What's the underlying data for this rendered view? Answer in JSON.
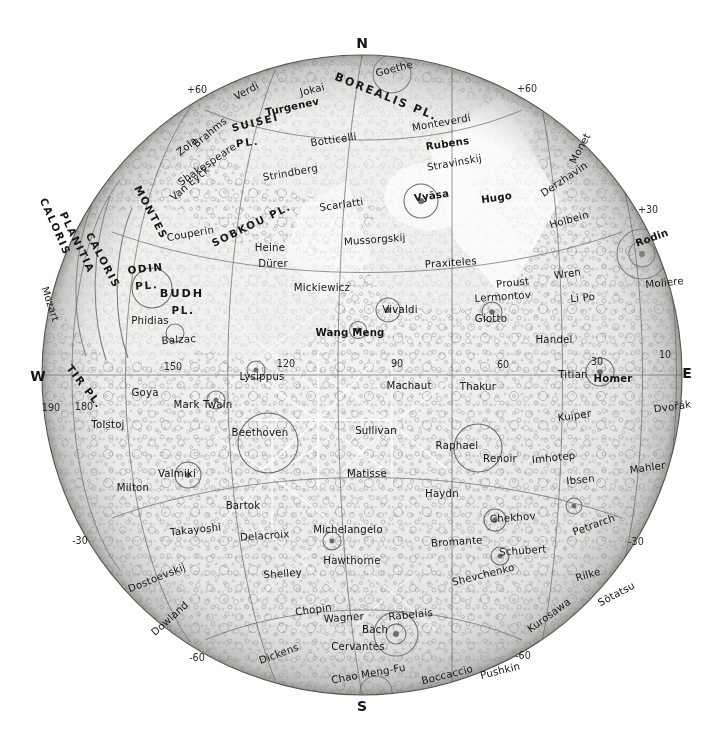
{
  "map": {
    "title": "Mercury",
    "projection": "orthographic hemisphere",
    "center": {
      "x": 362,
      "y": 375,
      "radius": 320
    },
    "cardinals": [
      {
        "name": "north",
        "label": "N",
        "x": 362,
        "y": 48
      },
      {
        "name": "south",
        "label": "S",
        "x": 362,
        "y": 711
      },
      {
        "name": "west",
        "label": "W",
        "x": 38,
        "y": 381
      },
      {
        "name": "east",
        "label": "E",
        "x": 687,
        "y": 378
      }
    ],
    "latitude_labels": [
      {
        "label": "+60",
        "x": 197,
        "y": 93,
        "side": "left"
      },
      {
        "label": "+60",
        "x": 527,
        "y": 92,
        "side": "right"
      },
      {
        "label": "+30",
        "x": 648,
        "y": 213,
        "side": "right"
      },
      {
        "label": "-30",
        "x": 636,
        "y": 545,
        "side": "right"
      },
      {
        "label": "-30",
        "x": 80,
        "y": 544,
        "side": "left"
      },
      {
        "label": "-60",
        "x": 197,
        "y": 661,
        "side": "left"
      },
      {
        "label": "-60",
        "x": 523,
        "y": 659,
        "side": "right"
      }
    ],
    "longitude_labels": [
      {
        "label": "190",
        "x": 51,
        "y": 411
      },
      {
        "label": "180",
        "x": 84,
        "y": 410
      },
      {
        "label": "150",
        "x": 173,
        "y": 370
      },
      {
        "label": "120",
        "x": 286,
        "y": 367
      },
      {
        "label": "90",
        "x": 397,
        "y": 367
      },
      {
        "label": "60",
        "x": 503,
        "y": 368
      },
      {
        "label": "30",
        "x": 597,
        "y": 365
      },
      {
        "label": "10",
        "x": 665,
        "y": 358
      }
    ],
    "named_regions": [
      {
        "label": "BOREALIS PL.",
        "x": 385,
        "y": 100,
        "rotate": 22,
        "size": "feature"
      },
      {
        "label": "SUISEI",
        "x": 256,
        "y": 126,
        "rotate": -14,
        "size": "feature-sm"
      },
      {
        "label": "PL.",
        "x": 248,
        "y": 146,
        "rotate": -8,
        "size": "feature-sm"
      },
      {
        "label": "SOBKOU PL.",
        "x": 253,
        "y": 228,
        "rotate": -26,
        "size": "feature-sm"
      },
      {
        "label": "CALORIS",
        "x": 52,
        "y": 228,
        "rotate": 66,
        "size": "feature-sm"
      },
      {
        "label": "PLANITIA",
        "x": 74,
        "y": 244,
        "rotate": 64,
        "size": "feature-sm"
      },
      {
        "label": "CALORIS",
        "x": 100,
        "y": 262,
        "rotate": 62,
        "size": "feature-sm"
      },
      {
        "label": "MONTES",
        "x": 148,
        "y": 214,
        "rotate": 62,
        "size": "feature-sm"
      },
      {
        "label": "ODIN",
        "x": 146,
        "y": 272,
        "rotate": -6,
        "size": "feature-sm"
      },
      {
        "label": "PL.",
        "x": 147,
        "y": 289,
        "rotate": -4,
        "size": "feature-sm"
      },
      {
        "label": "BUDH",
        "x": 182,
        "y": 297,
        "rotate": 0,
        "size": "feature"
      },
      {
        "label": "PL.",
        "x": 183,
        "y": 314,
        "rotate": 0,
        "size": "feature-sm"
      },
      {
        "label": "TIR PL.",
        "x": 82,
        "y": 389,
        "rotate": 52,
        "size": "feature-sm"
      }
    ],
    "craters": [
      {
        "label": "Goethe",
        "x": 395,
        "y": 72,
        "rotate": -14
      },
      {
        "label": "Jokai",
        "x": 313,
        "y": 93,
        "rotate": -14
      },
      {
        "label": "Verdi",
        "x": 248,
        "y": 94,
        "rotate": -28
      },
      {
        "label": "Turgenev",
        "x": 293,
        "y": 110,
        "rotate": -12,
        "bold": true
      },
      {
        "label": "Brahms",
        "x": 212,
        "y": 135,
        "rotate": -40
      },
      {
        "label": "Zola",
        "x": 189,
        "y": 149,
        "rotate": -38
      },
      {
        "label": "Monteverdi",
        "x": 442,
        "y": 126,
        "rotate": -10
      },
      {
        "label": "Botticelli",
        "x": 334,
        "y": 143,
        "rotate": -8
      },
      {
        "label": "Rubens",
        "x": 448,
        "y": 147,
        "rotate": -8,
        "bold": true
      },
      {
        "label": "Shakespeare",
        "x": 209,
        "y": 167,
        "rotate": -34
      },
      {
        "label": "Strindberg",
        "x": 291,
        "y": 176,
        "rotate": -10
      },
      {
        "label": "Stravinskij",
        "x": 455,
        "y": 166,
        "rotate": -10
      },
      {
        "label": "Derzhavin",
        "x": 566,
        "y": 182,
        "rotate": -34
      },
      {
        "label": "Monet",
        "x": 583,
        "y": 150,
        "rotate": -62
      },
      {
        "label": "Van Eyck",
        "x": 192,
        "y": 186,
        "rotate": -40
      },
      {
        "label": "Scarlatti",
        "x": 342,
        "y": 208,
        "rotate": -8
      },
      {
        "label": "Vyāsa",
        "x": 432,
        "y": 199,
        "rotate": -8,
        "bold": true
      },
      {
        "label": "Hugo",
        "x": 497,
        "y": 201,
        "rotate": -8,
        "bold": true
      },
      {
        "label": "Holbein",
        "x": 570,
        "y": 223,
        "rotate": -16
      },
      {
        "label": "Rodin",
        "x": 653,
        "y": 241,
        "rotate": -20,
        "bold": true
      },
      {
        "label": "Couperin",
        "x": 191,
        "y": 237,
        "rotate": -10
      },
      {
        "label": "Heine",
        "x": 270,
        "y": 251
      },
      {
        "label": "Mussorgskij",
        "x": 375,
        "y": 243,
        "rotate": -4
      },
      {
        "label": "Praxiteles",
        "x": 451,
        "y": 266,
        "rotate": -4
      },
      {
        "label": "Wren",
        "x": 568,
        "y": 277,
        "rotate": -8
      },
      {
        "label": "Moliere",
        "x": 665,
        "y": 286,
        "rotate": -6
      },
      {
        "label": "Dürer",
        "x": 273,
        "y": 267
      },
      {
        "label": "Proust",
        "x": 513,
        "y": 286,
        "rotate": -6
      },
      {
        "label": "Lermontov",
        "x": 503,
        "y": 300,
        "rotate": -4
      },
      {
        "label": "Li Po",
        "x": 583,
        "y": 301,
        "rotate": -6
      },
      {
        "label": "Mickiewicz",
        "x": 322,
        "y": 291
      },
      {
        "label": "Vivaldi",
        "x": 400,
        "y": 313
      },
      {
        "label": "Giotto",
        "x": 491,
        "y": 322
      },
      {
        "label": "Phidias",
        "x": 150,
        "y": 324
      },
      {
        "label": "Balzac",
        "x": 179,
        "y": 343,
        "rotate": -4
      },
      {
        "label": "Wang Meng",
        "x": 350,
        "y": 336,
        "bold": true
      },
      {
        "label": "Handel",
        "x": 554,
        "y": 343
      },
      {
        "label": "Mozart",
        "x": 47,
        "y": 305,
        "rotate": 72
      },
      {
        "label": "Lysippus",
        "x": 262,
        "y": 380
      },
      {
        "label": "Machaut",
        "x": 409,
        "y": 389
      },
      {
        "label": "Thakur",
        "x": 478,
        "y": 390
      },
      {
        "label": "Titian",
        "x": 573,
        "y": 378
      },
      {
        "label": "Homer",
        "x": 613,
        "y": 382,
        "bold": true
      },
      {
        "label": "Goya",
        "x": 145,
        "y": 396
      },
      {
        "label": "Mark Twain",
        "x": 203,
        "y": 408
      },
      {
        "label": "Kuiper",
        "x": 575,
        "y": 419,
        "rotate": -8
      },
      {
        "label": "Dvořák",
        "x": 673,
        "y": 410,
        "rotate": -8
      },
      {
        "label": "Tolstoj",
        "x": 108,
        "y": 428
      },
      {
        "label": "Beethoven",
        "x": 260,
        "y": 436
      },
      {
        "label": "Sullivan",
        "x": 376,
        "y": 434
      },
      {
        "label": "Raphael",
        "x": 457,
        "y": 449
      },
      {
        "label": "Renoir",
        "x": 500,
        "y": 462
      },
      {
        "label": "Imhotep",
        "x": 554,
        "y": 461,
        "rotate": -6
      },
      {
        "label": "Mahler",
        "x": 648,
        "y": 471,
        "rotate": -8
      },
      {
        "label": "Valmiki",
        "x": 177,
        "y": 477
      },
      {
        "label": "Ibsen",
        "x": 581,
        "y": 483,
        "rotate": -6
      },
      {
        "label": "Matisse",
        "x": 367,
        "y": 477
      },
      {
        "label": "Milton",
        "x": 133,
        "y": 491
      },
      {
        "label": "Bartok",
        "x": 243,
        "y": 509
      },
      {
        "label": "Haydn",
        "x": 442,
        "y": 497
      },
      {
        "label": "Chekhov",
        "x": 513,
        "y": 521,
        "rotate": -4
      },
      {
        "label": "Petrarch",
        "x": 595,
        "y": 528,
        "rotate": -20
      },
      {
        "label": "Takayoshi",
        "x": 196,
        "y": 533,
        "rotate": -6
      },
      {
        "label": "Delacroix",
        "x": 265,
        "y": 539,
        "rotate": -4
      },
      {
        "label": "Michelangelo",
        "x": 348,
        "y": 533
      },
      {
        "label": "Bromante",
        "x": 457,
        "y": 545,
        "rotate": -4
      },
      {
        "label": "Schubert",
        "x": 523,
        "y": 554,
        "rotate": -4
      },
      {
        "label": "Hawthorne",
        "x": 352,
        "y": 564
      },
      {
        "label": "Shevchenko",
        "x": 484,
        "y": 578,
        "rotate": -14
      },
      {
        "label": "Dostoevskij",
        "x": 158,
        "y": 581,
        "rotate": -22
      },
      {
        "label": "Shelley",
        "x": 283,
        "y": 577,
        "rotate": -4
      },
      {
        "label": "Rilke",
        "x": 589,
        "y": 578,
        "rotate": -16
      },
      {
        "label": "Sōtatsu",
        "x": 618,
        "y": 597,
        "rotate": -28
      },
      {
        "label": "Kurosawa",
        "x": 551,
        "y": 618,
        "rotate": -36
      },
      {
        "label": "Chopin",
        "x": 314,
        "y": 613,
        "rotate": -8
      },
      {
        "label": "Wagner",
        "x": 344,
        "y": 621,
        "rotate": -4
      },
      {
        "label": "Rabelais",
        "x": 411,
        "y": 618,
        "rotate": -6
      },
      {
        "label": "Dowland",
        "x": 172,
        "y": 621,
        "rotate": -42
      },
      {
        "label": "Bach",
        "x": 375,
        "y": 633
      },
      {
        "label": "Cervantes",
        "x": 358,
        "y": 650
      },
      {
        "label": "Dickens",
        "x": 280,
        "y": 657,
        "rotate": -20
      },
      {
        "label": "Chao Meng-Fu",
        "x": 369,
        "y": 677,
        "rotate": -10
      },
      {
        "label": "Boccaccio",
        "x": 448,
        "y": 678,
        "rotate": -14
      },
      {
        "label": "Pushkin",
        "x": 501,
        "y": 674,
        "rotate": -14
      }
    ]
  }
}
